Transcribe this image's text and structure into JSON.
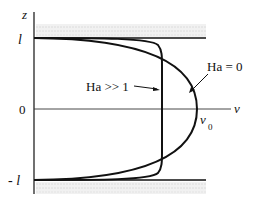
{
  "diagram": {
    "axes": {
      "vertical_label": "z",
      "horizontal_label": "v",
      "ticks": {
        "top": "l",
        "middle": "0",
        "bottom": "- l"
      }
    },
    "peak_label": {
      "base": "v",
      "subscript": "0"
    },
    "curves": [
      {
        "name": "ha-0",
        "label": "Ha = 0",
        "shape": "parabolic"
      },
      {
        "name": "ha-large",
        "label": "Ha >> 1",
        "shape": "flat"
      }
    ],
    "colors": {
      "line": "#111111",
      "wall_hatch": "#d9d9d9",
      "background": "#ffffff"
    }
  }
}
